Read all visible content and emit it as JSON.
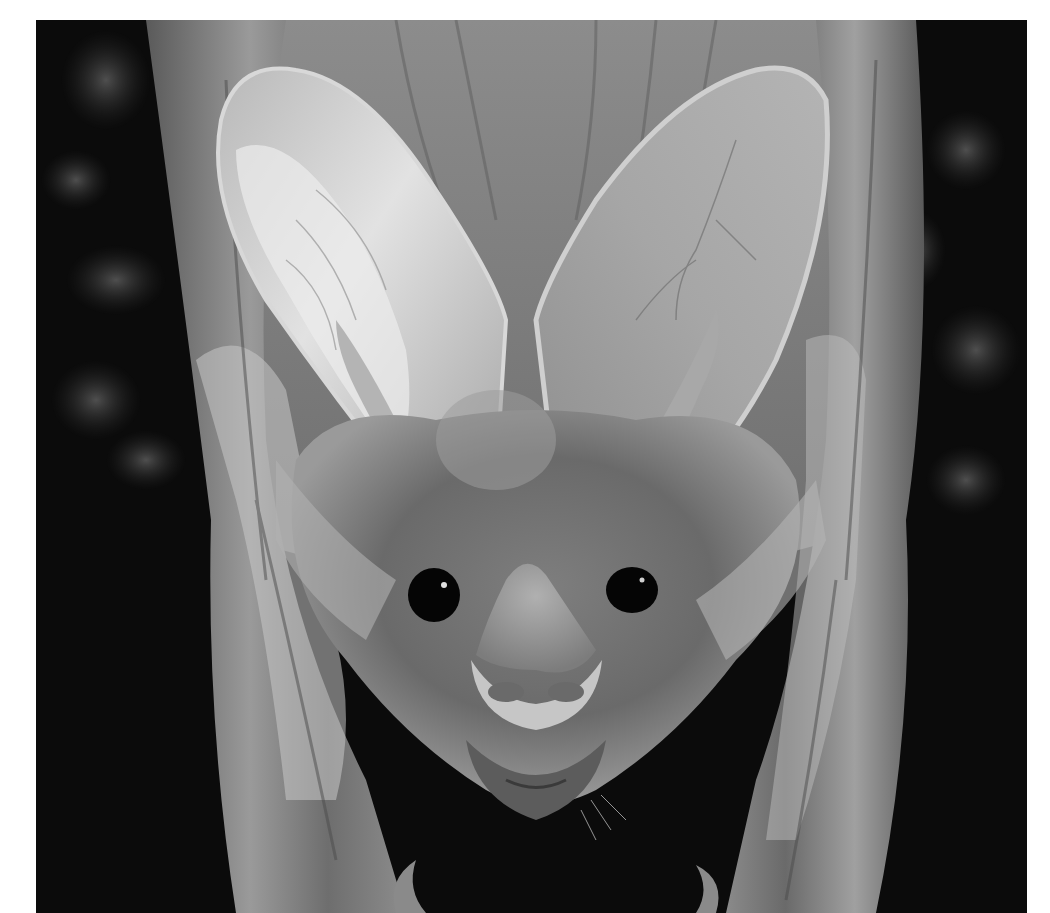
{
  "image": {
    "alt": "Grayscale close-up portrait of a big-eared bat with a prominent nose-leaf, facing the camera, framed by its folded wings against a dark background",
    "subject": "bat",
    "style": "black-and-white photograph",
    "background_color": "#ffffff",
    "frame": {
      "x": 36,
      "y": 20,
      "width": 991,
      "height": 893
    },
    "palette": {
      "background_dark": "#0a0a0a",
      "bokeh_gray": "#3a3a3a",
      "fur_mid": "#8a8a8a",
      "ear_light": "#c8c8c8",
      "ear_highlight": "#e6e6e6",
      "wing_gray": "#7a7a7a",
      "eye_black": "#050505",
      "noseleaf": "#9a9a9a"
    }
  }
}
